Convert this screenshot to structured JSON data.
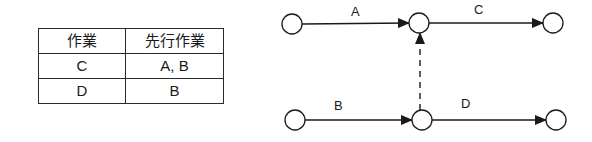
{
  "table": {
    "headers": [
      "作業",
      "先行作業"
    ],
    "rows": [
      {
        "task": "C",
        "predecessors": "A, B"
      },
      {
        "task": "D",
        "predecessors": "B"
      }
    ]
  },
  "network": {
    "nodes": [
      {
        "id": "n1",
        "cx": 292,
        "cy": 24
      },
      {
        "id": "n2",
        "cx": 419,
        "cy": 23
      },
      {
        "id": "n3",
        "cx": 553,
        "cy": 23
      },
      {
        "id": "n4",
        "cx": 295,
        "cy": 120
      },
      {
        "id": "n5",
        "cx": 422,
        "cy": 120
      },
      {
        "id": "n6",
        "cx": 556,
        "cy": 120
      }
    ],
    "activities": [
      {
        "label": "A",
        "from": "n1",
        "to": "n2",
        "style": "solid"
      },
      {
        "label": "C",
        "from": "n2",
        "to": "n3",
        "style": "solid"
      },
      {
        "label": "B",
        "from": "n4",
        "to": "n5",
        "style": "solid"
      },
      {
        "label": "D",
        "from": "n5",
        "to": "n6",
        "style": "solid"
      },
      {
        "label": "",
        "from": "n5",
        "to": "n2",
        "style": "dashed",
        "type": "dummy"
      }
    ],
    "labels": {
      "A": "A",
      "B": "B",
      "C": "C",
      "D": "D"
    }
  },
  "colors": {
    "stroke": "#1a1a1a",
    "background": "#ffffff"
  }
}
